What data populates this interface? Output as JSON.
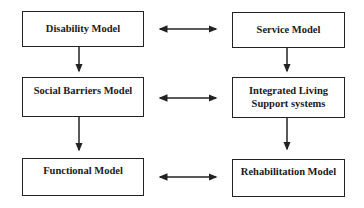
{
  "diagram": {
    "left_column": [
      {
        "id": "disability",
        "label": "Disability Model"
      },
      {
        "id": "social",
        "label": "Social Barriers Model"
      },
      {
        "id": "functional",
        "label": "Functional Model"
      }
    ],
    "right_column": [
      {
        "id": "service",
        "label": "Service Model"
      },
      {
        "id": "integrated",
        "label_line1": "Integrated Living",
        "label_line2": "Support systems"
      },
      {
        "id": "rehab",
        "label": "Rehabilitation Model"
      }
    ],
    "edges": [
      {
        "from": "disability",
        "to": "social",
        "type": "arrow-down"
      },
      {
        "from": "social",
        "to": "functional",
        "type": "arrow-down"
      },
      {
        "from": "service",
        "to": "integrated",
        "type": "arrow-down"
      },
      {
        "from": "integrated",
        "to": "rehab",
        "type": "arrow-down"
      },
      {
        "from": "disability",
        "to": "service",
        "type": "bidirectional"
      },
      {
        "from": "social",
        "to": "integrated",
        "type": "bidirectional"
      },
      {
        "from": "functional",
        "to": "rehab",
        "type": "bidirectional"
      }
    ]
  }
}
